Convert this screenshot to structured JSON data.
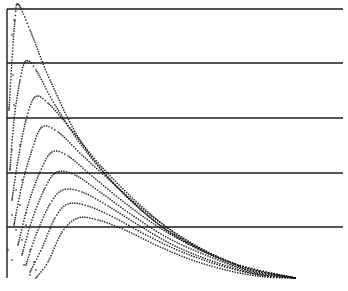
{
  "chart_data": {
    "type": "line",
    "title": "",
    "xlabel": "",
    "ylabel": "",
    "grid": "horizontal",
    "legend": "none",
    "style": "dotted point plot, black on white",
    "colors": {
      "background": "#ffffff",
      "ink": "#1a1a1a"
    },
    "frame": {
      "left_axis_x": 7,
      "top_y": 9,
      "right_x": 343,
      "bottom_y": 278
    },
    "horizontal_lines_px": [
      9,
      63,
      118,
      173,
      227
    ],
    "series": [
      {
        "name": "curve-1",
        "peak_px": [
          18,
          4
        ],
        "points_px": [
          [
            9,
            110
          ],
          [
            12,
            60
          ],
          [
            15,
            20
          ],
          [
            18,
            4
          ],
          [
            30,
            30
          ],
          [
            50,
            80
          ],
          [
            80,
            140
          ],
          [
            120,
            190
          ],
          [
            170,
            232
          ],
          [
            230,
            262
          ],
          [
            295,
            278
          ]
        ]
      },
      {
        "name": "curve-2",
        "peak_px": [
          26,
          61
        ],
        "points_px": [
          [
            10,
            170
          ],
          [
            14,
            120
          ],
          [
            20,
            80
          ],
          [
            26,
            61
          ],
          [
            36,
            70
          ],
          [
            55,
            105
          ],
          [
            85,
            150
          ],
          [
            125,
            195
          ],
          [
            175,
            236
          ],
          [
            235,
            264
          ],
          [
            295,
            278
          ]
        ]
      },
      {
        "name": "curve-3",
        "peak_px": [
          35,
          97
        ],
        "points_px": [
          [
            12,
            200
          ],
          [
            18,
            160
          ],
          [
            26,
            120
          ],
          [
            35,
            97
          ],
          [
            48,
            103
          ],
          [
            70,
            128
          ],
          [
            100,
            165
          ],
          [
            140,
            205
          ],
          [
            185,
            240
          ],
          [
            240,
            266
          ],
          [
            295,
            278
          ]
        ]
      },
      {
        "name": "curve-4",
        "peak_px": [
          42,
          127
        ],
        "points_px": [
          [
            14,
            225
          ],
          [
            22,
            185
          ],
          [
            32,
            150
          ],
          [
            42,
            127
          ],
          [
            58,
            132
          ],
          [
            82,
            155
          ],
          [
            115,
            185
          ],
          [
            150,
            215
          ],
          [
            195,
            245
          ],
          [
            245,
            268
          ],
          [
            295,
            278
          ]
        ]
      },
      {
        "name": "curve-5",
        "peak_px": [
          52,
          152
        ],
        "points_px": [
          [
            18,
            245
          ],
          [
            28,
            205
          ],
          [
            40,
            172
          ],
          [
            52,
            152
          ],
          [
            68,
            156
          ],
          [
            92,
            176
          ],
          [
            125,
            203
          ],
          [
            160,
            228
          ],
          [
            200,
            250
          ],
          [
            248,
            270
          ],
          [
            295,
            278
          ]
        ]
      },
      {
        "name": "curve-6",
        "peak_px": [
          57,
          172
        ],
        "points_px": [
          [
            22,
            255
          ],
          [
            32,
            220
          ],
          [
            45,
            188
          ],
          [
            57,
            172
          ],
          [
            75,
            175
          ],
          [
            100,
            192
          ],
          [
            132,
            215
          ],
          [
            168,
            238
          ],
          [
            208,
            256
          ],
          [
            252,
            272
          ],
          [
            295,
            278
          ]
        ]
      },
      {
        "name": "curve-7",
        "peak_px": [
          63,
          190
        ],
        "points_px": [
          [
            26,
            265
          ],
          [
            36,
            235
          ],
          [
            50,
            204
          ],
          [
            63,
            190
          ],
          [
            82,
            192
          ],
          [
            108,
            206
          ],
          [
            140,
            226
          ],
          [
            175,
            246
          ],
          [
            215,
            262
          ],
          [
            256,
            274
          ],
          [
            295,
            278
          ]
        ]
      },
      {
        "name": "curve-8",
        "peak_px": [
          68,
          204
        ],
        "points_px": [
          [
            30,
            272
          ],
          [
            42,
            248
          ],
          [
            55,
            218
          ],
          [
            68,
            204
          ],
          [
            88,
            206
          ],
          [
            115,
            218
          ],
          [
            148,
            236
          ],
          [
            182,
            252
          ],
          [
            222,
            266
          ],
          [
            260,
            275
          ],
          [
            295,
            278
          ]
        ]
      },
      {
        "name": "curve-9",
        "peak_px": [
          78,
          218
        ],
        "points_px": [
          [
            36,
            278
          ],
          [
            48,
            262
          ],
          [
            62,
            232
          ],
          [
            78,
            218
          ],
          [
            98,
            220
          ],
          [
            125,
            230
          ],
          [
            158,
            246
          ],
          [
            192,
            260
          ],
          [
            230,
            271
          ],
          [
            265,
            277
          ],
          [
            295,
            278
          ]
        ]
      }
    ],
    "scatter_noise_px": [
      [
        14,
        20
      ],
      [
        12,
        35
      ],
      [
        13,
        75
      ],
      [
        14,
        105
      ],
      [
        12,
        150
      ],
      [
        20,
        145
      ],
      [
        16,
        190
      ],
      [
        22,
        180
      ],
      [
        12,
        215
      ],
      [
        20,
        205
      ],
      [
        26,
        213
      ],
      [
        16,
        230
      ],
      [
        26,
        225
      ],
      [
        12,
        260
      ],
      [
        22,
        240
      ],
      [
        30,
        250
      ],
      [
        24,
        265
      ],
      [
        34,
        262
      ],
      [
        30,
        275
      ],
      [
        36,
        270
      ],
      [
        8,
        250
      ]
    ]
  }
}
